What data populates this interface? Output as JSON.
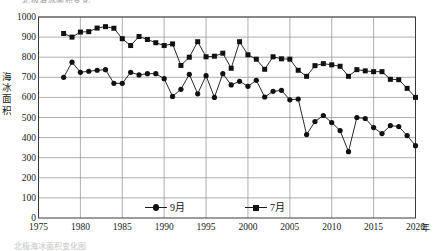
{
  "figure": {
    "top_title_fragment": "北极海冰面积变化",
    "bottom_note_fragment": "北极海冰面积变化图",
    "axis_unit_x": "年",
    "y_axis_caption_chars": [
      "海",
      "冰",
      "面",
      "积"
    ]
  },
  "legend": {
    "position": "inside-bottom",
    "items": [
      {
        "label": "9月",
        "marker": "circle",
        "color": "#111111"
      },
      {
        "label": "7月",
        "marker": "square",
        "color": "#111111"
      }
    ]
  },
  "chart_data": {
    "type": "line",
    "title": "北极海冰面积变化",
    "xlabel": "年",
    "ylabel": "海冰面积",
    "xlim": [
      1975,
      2020
    ],
    "ylim": [
      0,
      1000
    ],
    "xticks": [
      1975,
      1980,
      1985,
      1990,
      1995,
      2000,
      2005,
      2010,
      2015,
      2020
    ],
    "yticks": [
      0,
      100,
      200,
      300,
      400,
      500,
      600,
      700,
      800,
      900,
      1000
    ],
    "grid": "both",
    "legend_position": "inside-bottom",
    "x": [
      1978,
      1979,
      1980,
      1981,
      1982,
      1983,
      1984,
      1985,
      1986,
      1987,
      1988,
      1989,
      1990,
      1991,
      1992,
      1993,
      1994,
      1995,
      1996,
      1997,
      1998,
      1999,
      2000,
      2001,
      2002,
      2003,
      2004,
      2005,
      2006,
      2007,
      2008,
      2009,
      2010,
      2011,
      2012,
      2013,
      2014,
      2015,
      2016,
      2017,
      2018,
      2019,
      2020
    ],
    "series": [
      {
        "name": "7月",
        "marker": "square",
        "color": "#111111",
        "values": [
          918,
          900,
          925,
          927,
          945,
          952,
          944,
          892,
          858,
          903,
          888,
          872,
          858,
          866,
          759,
          800,
          877,
          802,
          805,
          820,
          745,
          877,
          812,
          790,
          740,
          802,
          792,
          790,
          735,
          705,
          758,
          768,
          762,
          755,
          705,
          738,
          732,
          728,
          728,
          690,
          688,
          645,
          600
        ],
        "unit": "万平方千米"
      },
      {
        "name": "9月",
        "marker": "circle",
        "color": "#111111",
        "values": [
          700,
          775,
          725,
          730,
          735,
          738,
          670,
          670,
          725,
          712,
          718,
          718,
          693,
          605,
          640,
          715,
          618,
          708,
          600,
          718,
          662,
          680,
          655,
          685,
          602,
          630,
          635,
          588,
          592,
          415,
          480,
          510,
          475,
          435,
          330,
          500,
          495,
          450,
          420,
          460,
          455,
          410,
          360
        ],
        "unit": "万平方千米"
      }
    ]
  }
}
